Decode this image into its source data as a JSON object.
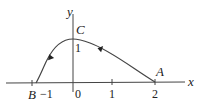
{
  "diagram": {
    "axes": {
      "x_label": "x",
      "y_label": "y",
      "x_ticks": [
        "−1",
        "0",
        "1",
        "2"
      ],
      "y_ticks": [
        "1"
      ]
    },
    "points": {
      "A": {
        "label": "A",
        "coords": [
          2,
          0
        ]
      },
      "B": {
        "label": "B",
        "coords": [
          -0.9,
          0
        ]
      },
      "C": {
        "label": "C",
        "coords": [
          0,
          1
        ]
      }
    },
    "curve": {
      "description": "Curve from A(2,0) rising to C(0,1) then descending to B on negative x-axis, with arrows indicating direction A to C to B",
      "direction": "A -> C -> B"
    },
    "colors": {
      "stroke": "#333333",
      "background": "#ffffff"
    }
  }
}
